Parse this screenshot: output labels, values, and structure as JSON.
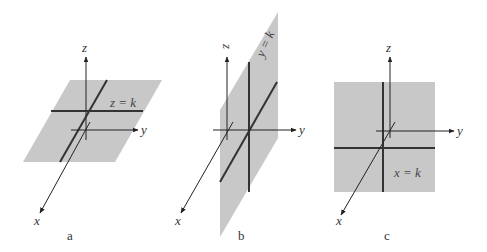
{
  "figure": {
    "panels": [
      {
        "caption": "a",
        "equation": "z = k",
        "axes": {
          "x": "x",
          "y": "y",
          "z": "z"
        },
        "plane_color": "#c8c8c8"
      },
      {
        "caption": "b",
        "equation": "y = k",
        "axes": {
          "x": "x",
          "y": "y",
          "z": "z"
        },
        "plane_color": "#c8c8c8"
      },
      {
        "caption": "c",
        "equation": "x = k",
        "axes": {
          "x": "x",
          "y": "y",
          "z": "z"
        },
        "plane_color": "#c8c8c8"
      }
    ]
  }
}
